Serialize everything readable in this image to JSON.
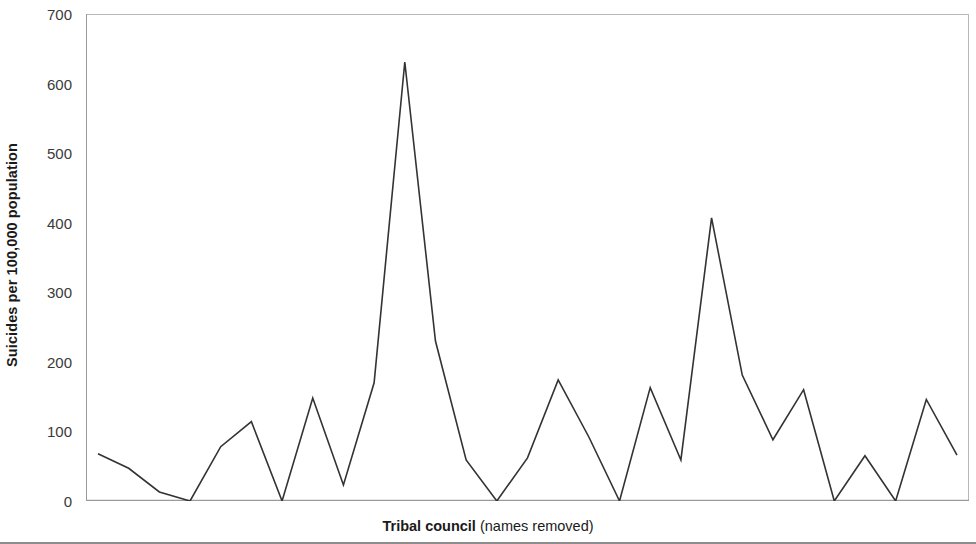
{
  "chart_data": {
    "type": "line",
    "title": "",
    "subtitle": "",
    "xlabel_bold": "Tribal council",
    "xlabel_plain": " (names removed)",
    "xlabel": "Tribal council (names removed)",
    "ylabel": "Suicides per 100,000 population",
    "ylim": [
      0,
      700
    ],
    "xlim": [
      0,
      29
    ],
    "ytick_labels": [
      "0",
      "100",
      "200",
      "300",
      "400",
      "500",
      "600",
      "700"
    ],
    "ytick_values": [
      0,
      100,
      200,
      300,
      400,
      500,
      600,
      700
    ],
    "xtick_labels": [],
    "grid": false,
    "legend": null,
    "legend_position": "none",
    "line_color": "#333333",
    "line_width": 1.6,
    "axis_color": "#b0b0b0",
    "categories": [
      1,
      2,
      3,
      4,
      5,
      6,
      7,
      8,
      9,
      10,
      11,
      12,
      13,
      14,
      15,
      16,
      17,
      18,
      19,
      20,
      21,
      22,
      23,
      24,
      25,
      26,
      27,
      28,
      29
    ],
    "values": [
      68,
      47,
      13,
      0,
      78,
      114,
      0,
      148,
      23,
      170,
      631,
      230,
      59,
      0,
      62,
      174,
      92,
      0,
      163,
      59,
      407,
      181,
      88,
      160,
      0,
      65,
      0,
      146,
      66
    ],
    "annotations": []
  },
  "axis": {
    "y_title": "Suicides per 100,000 population"
  }
}
